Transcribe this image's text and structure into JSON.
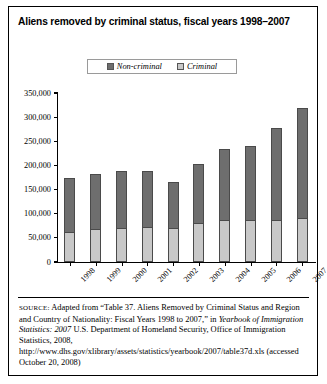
{
  "figure": {
    "title": "Aliens removed by criminal status, fiscal years 1998–2007",
    "source_label": "SOURCE:",
    "source_text_1": " Adapted from “Table 37. Aliens Removed by Criminal Status and Region and Country of Nationality: Fiscal Years 1998 to 2007,” in ",
    "source_italic": "Yearbook of Immigration Statistics: 2007",
    "source_text_2": " U.S. Department of Homeland Security, Office of Immigration Statistics, 2008, http://www.dhs.gov/xlibrary/assets/statistics/yearbook/2007/table37d.xls (accessed October 20, 2008)"
  },
  "legend": {
    "entries": [
      {
        "label": "Non-criminal",
        "color": "#6e6e6e",
        "swatch_name": "legend-swatch-non-criminal"
      },
      {
        "label": "Criminal",
        "color": "#c8c8c8",
        "swatch_name": "legend-swatch-criminal"
      }
    ]
  },
  "chart_data": {
    "type": "bar",
    "subtype": "stacked-vertical",
    "title": "Aliens removed by criminal status, fiscal years 1998–2007",
    "xlabel": "",
    "ylabel": "",
    "ylim": [
      0,
      350000
    ],
    "ytick_values": [
      0,
      50000,
      100000,
      150000,
      200000,
      250000,
      300000,
      350000
    ],
    "ytick_labels": [
      "0",
      "50,000",
      "100,000",
      "150,000",
      "200,000",
      "250,000",
      "300,000",
      "350,000"
    ],
    "grid": false,
    "legend_position": "top-center",
    "categories": [
      "1998",
      "1999",
      "2000",
      "2001",
      "2002",
      "2003",
      "2004",
      "2005",
      "2006",
      "2007"
    ],
    "series": [
      {
        "name": "Criminal",
        "color": "#c8c8c8",
        "values": [
          62000,
          68000,
          71000,
          72000,
          71000,
          81000,
          86000,
          87000,
          86000,
          91000
        ]
      },
      {
        "name": "Non-criminal",
        "color": "#6e6e6e",
        "values": [
          113000,
          114000,
          117000,
          117000,
          94000,
          121000,
          148000,
          153000,
          191000,
          228000
        ]
      }
    ],
    "totals": [
      175000,
      182000,
      188000,
      189000,
      165000,
      202000,
      234000,
      240000,
      277000,
      319000
    ]
  },
  "colors": {
    "non_criminal": "#6e6e6e",
    "criminal": "#c8c8c8",
    "axis": "#000000",
    "frame": "#000000",
    "background": "#ffffff"
  }
}
